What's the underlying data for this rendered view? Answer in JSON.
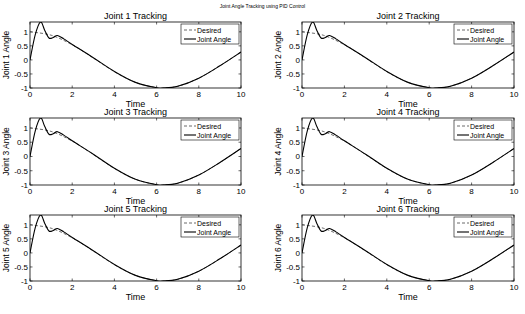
{
  "suptitle": "Joint Angle Tracking using PID Control",
  "chart_data": [
    {
      "type": "line",
      "title": "Joint 1 Tracking",
      "xlabel": "Time",
      "ylabel": "Joint 1 Angle",
      "xlim": [
        0,
        10
      ],
      "ylim": [
        -1,
        1.35
      ],
      "xticks": [
        0,
        2,
        4,
        6,
        8,
        10
      ],
      "yticks": [
        -1,
        -0.5,
        0,
        0.5,
        1
      ],
      "legend": [
        "Desired",
        "Joint Angle"
      ],
      "legend_position": "northeast",
      "series": [
        {
          "name": "Desired",
          "style": "dashed",
          "x": [
            0,
            1,
            2,
            3,
            4,
            5,
            6,
            6.3,
            7,
            8,
            9,
            10
          ],
          "y": [
            1,
            0.88,
            0.54,
            0.07,
            -0.42,
            -0.8,
            -0.99,
            -1,
            -0.94,
            -0.65,
            -0.21,
            0.28
          ]
        },
        {
          "name": "Joint Angle",
          "style": "solid",
          "x": [
            0,
            0.25,
            0.5,
            0.7,
            0.9,
            1.1,
            1.3,
            1.6,
            2,
            3,
            4,
            5,
            6,
            6.3,
            7,
            8,
            9,
            10
          ],
          "y": [
            0,
            0.9,
            1.35,
            1.05,
            0.78,
            0.8,
            0.87,
            0.75,
            0.55,
            0.08,
            -0.41,
            -0.8,
            -0.99,
            -1,
            -0.94,
            -0.65,
            -0.21,
            0.28
          ]
        }
      ]
    },
    {
      "type": "line",
      "title": "Joint 2 Tracking",
      "xlabel": "Time",
      "ylabel": "Joint 2 Angle",
      "xlim": [
        0,
        10
      ],
      "ylim": [
        -1,
        1.35
      ],
      "xticks": [
        0,
        2,
        4,
        6,
        8,
        10
      ],
      "yticks": [
        -1,
        -0.5,
        0,
        0.5,
        1
      ],
      "legend": [
        "Desired",
        "Joint Angle"
      ],
      "legend_position": "northeast",
      "series": [
        {
          "name": "Desired",
          "style": "dashed",
          "x": [
            0,
            1,
            2,
            3,
            4,
            5,
            6,
            6.3,
            7,
            8,
            9,
            10
          ],
          "y": [
            1,
            0.88,
            0.54,
            0.07,
            -0.42,
            -0.8,
            -0.99,
            -1,
            -0.94,
            -0.65,
            -0.21,
            0.28
          ]
        },
        {
          "name": "Joint Angle",
          "style": "solid",
          "x": [
            0,
            0.25,
            0.5,
            0.7,
            0.9,
            1.1,
            1.3,
            1.6,
            2,
            3,
            4,
            5,
            6,
            6.3,
            7,
            8,
            9,
            10
          ],
          "y": [
            0,
            0.9,
            1.35,
            1.05,
            0.78,
            0.8,
            0.87,
            0.75,
            0.55,
            0.08,
            -0.41,
            -0.8,
            -0.99,
            -1,
            -0.94,
            -0.65,
            -0.21,
            0.28
          ]
        }
      ]
    },
    {
      "type": "line",
      "title": "Joint 3 Tracking",
      "xlabel": "Time",
      "ylabel": "Joint 3 Angle",
      "xlim": [
        0,
        10
      ],
      "ylim": [
        -1,
        1.35
      ],
      "xticks": [
        0,
        2,
        4,
        6,
        8,
        10
      ],
      "yticks": [
        -1,
        -0.5,
        0,
        0.5,
        1
      ],
      "legend": [
        "Desired",
        "Joint Angle"
      ],
      "legend_position": "northeast",
      "series": [
        {
          "name": "Desired",
          "style": "dashed",
          "x": [
            0,
            1,
            2,
            3,
            4,
            5,
            6,
            6.3,
            7,
            8,
            9,
            10
          ],
          "y": [
            1,
            0.88,
            0.54,
            0.07,
            -0.42,
            -0.8,
            -0.99,
            -1,
            -0.94,
            -0.65,
            -0.21,
            0.28
          ]
        },
        {
          "name": "Joint Angle",
          "style": "solid",
          "x": [
            0,
            0.25,
            0.5,
            0.7,
            0.9,
            1.1,
            1.3,
            1.6,
            2,
            3,
            4,
            5,
            6,
            6.3,
            7,
            8,
            9,
            10
          ],
          "y": [
            0,
            0.9,
            1.35,
            1.05,
            0.78,
            0.8,
            0.87,
            0.75,
            0.55,
            0.08,
            -0.41,
            -0.8,
            -0.99,
            -1,
            -0.94,
            -0.65,
            -0.21,
            0.28
          ]
        }
      ]
    },
    {
      "type": "line",
      "title": "Joint 4 Tracking",
      "xlabel": "Time",
      "ylabel": "Joint 4 Angle",
      "xlim": [
        0,
        10
      ],
      "ylim": [
        -1,
        1.35
      ],
      "xticks": [
        0,
        2,
        4,
        6,
        8,
        10
      ],
      "yticks": [
        -1,
        -0.5,
        0,
        0.5,
        1
      ],
      "legend": [
        "Desired",
        "Joint Angle"
      ],
      "legend_position": "northeast",
      "series": [
        {
          "name": "Desired",
          "style": "dashed",
          "x": [
            0,
            1,
            2,
            3,
            4,
            5,
            6,
            6.3,
            7,
            8,
            9,
            10
          ],
          "y": [
            1,
            0.88,
            0.54,
            0.07,
            -0.42,
            -0.8,
            -0.99,
            -1,
            -0.94,
            -0.65,
            -0.21,
            0.28
          ]
        },
        {
          "name": "Joint Angle",
          "style": "solid",
          "x": [
            0,
            0.25,
            0.5,
            0.7,
            0.9,
            1.1,
            1.3,
            1.6,
            2,
            3,
            4,
            5,
            6,
            6.3,
            7,
            8,
            9,
            10
          ],
          "y": [
            0,
            0.9,
            1.35,
            1.05,
            0.78,
            0.8,
            0.87,
            0.75,
            0.55,
            0.08,
            -0.41,
            -0.8,
            -0.99,
            -1,
            -0.94,
            -0.65,
            -0.21,
            0.28
          ]
        }
      ]
    },
    {
      "type": "line",
      "title": "Joint 5 Tracking",
      "xlabel": "Time",
      "ylabel": "Joint 5 Angle",
      "xlim": [
        0,
        10
      ],
      "ylim": [
        -1,
        1.35
      ],
      "xticks": [
        0,
        2,
        4,
        6,
        8,
        10
      ],
      "yticks": [
        -1,
        -0.5,
        0,
        0.5,
        1
      ],
      "legend": [
        "Desired",
        "Joint Angle"
      ],
      "legend_position": "northeast",
      "series": [
        {
          "name": "Desired",
          "style": "dashed",
          "x": [
            0,
            1,
            2,
            3,
            4,
            5,
            6,
            6.3,
            7,
            8,
            9,
            10
          ],
          "y": [
            1,
            0.88,
            0.54,
            0.07,
            -0.42,
            -0.8,
            -0.99,
            -1,
            -0.94,
            -0.65,
            -0.21,
            0.28
          ]
        },
        {
          "name": "Joint Angle",
          "style": "solid",
          "x": [
            0,
            0.25,
            0.5,
            0.7,
            0.9,
            1.1,
            1.3,
            1.6,
            2,
            3,
            4,
            5,
            6,
            6.3,
            7,
            8,
            9,
            10
          ],
          "y": [
            0,
            0.9,
            1.35,
            1.05,
            0.78,
            0.8,
            0.87,
            0.75,
            0.55,
            0.08,
            -0.41,
            -0.8,
            -0.99,
            -1,
            -0.94,
            -0.65,
            -0.21,
            0.28
          ]
        }
      ]
    },
    {
      "type": "line",
      "title": "Joint 6 Tracking",
      "xlabel": "Time",
      "ylabel": "Joint 6 Angle",
      "xlim": [
        0,
        10
      ],
      "ylim": [
        -1,
        1.35
      ],
      "xticks": [
        0,
        2,
        4,
        6,
        8,
        10
      ],
      "yticks": [
        -1,
        -0.5,
        0,
        0.5,
        1
      ],
      "legend": [
        "Desired",
        "Joint Angle"
      ],
      "legend_position": "northeast",
      "series": [
        {
          "name": "Desired",
          "style": "dashed",
          "x": [
            0,
            1,
            2,
            3,
            4,
            5,
            6,
            6.3,
            7,
            8,
            9,
            10
          ],
          "y": [
            1,
            0.88,
            0.54,
            0.07,
            -0.42,
            -0.8,
            -0.99,
            -1,
            -0.94,
            -0.65,
            -0.21,
            0.28
          ]
        },
        {
          "name": "Joint Angle",
          "style": "solid",
          "x": [
            0,
            0.25,
            0.5,
            0.7,
            0.9,
            1.1,
            1.3,
            1.6,
            2,
            3,
            4,
            5,
            6,
            6.3,
            7,
            8,
            9,
            10
          ],
          "y": [
            0,
            0.9,
            1.35,
            1.05,
            0.78,
            0.8,
            0.87,
            0.75,
            0.55,
            0.08,
            -0.41,
            -0.8,
            -0.99,
            -1,
            -0.94,
            -0.65,
            -0.21,
            0.28
          ]
        }
      ]
    }
  ],
  "layout": {
    "axes_boxes": [
      {
        "x": 30,
        "y": 22,
        "w": 211,
        "h": 66
      },
      {
        "x": 302,
        "y": 22,
        "w": 212,
        "h": 66
      },
      {
        "x": 30,
        "y": 118,
        "w": 211,
        "h": 67
      },
      {
        "x": 302,
        "y": 118,
        "w": 212,
        "h": 67
      },
      {
        "x": 30,
        "y": 215,
        "w": 211,
        "h": 66
      },
      {
        "x": 302,
        "y": 215,
        "w": 212,
        "h": 66
      }
    ],
    "desired_color": "#444444",
    "actual_color": "#000000"
  }
}
